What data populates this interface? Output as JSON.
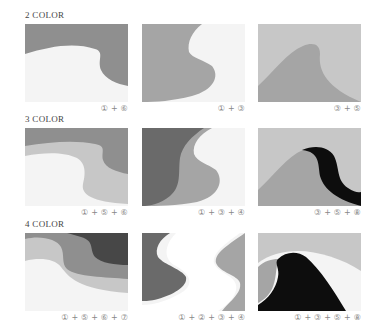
{
  "colors": {
    "c1": "#f4f4f4",
    "c2": "#ffffff",
    "c3": "#a5a5a5",
    "c4": "#6a6a6a",
    "c5": "#c7c7c7",
    "c6": "#8f8f8f",
    "c7": "#474747",
    "c8": "#0d0d0d"
  },
  "sections": [
    {
      "label": "2 COLOR",
      "panels": [
        {
          "caption": "① + ⑥"
        },
        {
          "caption": "① + ③"
        },
        {
          "caption": "③ + ⑤"
        }
      ]
    },
    {
      "label": "3 COLOR",
      "panels": [
        {
          "caption": "① + ⑤ + ⑥"
        },
        {
          "caption": "① + ③ + ④"
        },
        {
          "caption": "③ + ⑤ + ⑧"
        }
      ]
    },
    {
      "label": "4 COLOR",
      "panels": [
        {
          "caption": "① + ⑤ + ⑥ + ⑦"
        },
        {
          "caption": "① + ② + ③ + ④"
        },
        {
          "caption": "① + ③ + ⑤ + ⑧"
        }
      ]
    }
  ]
}
